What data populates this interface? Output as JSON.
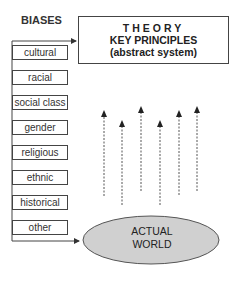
{
  "heading": "BIASES",
  "biases": [
    {
      "label": "cultural"
    },
    {
      "label": "racial"
    },
    {
      "label": "social class"
    },
    {
      "label": "gender"
    },
    {
      "label": "religious"
    },
    {
      "label": "ethnic"
    },
    {
      "label": "historical"
    },
    {
      "label": "other"
    }
  ],
  "theory": {
    "title": "THEORY",
    "line1": "KEY PRINCIPLES",
    "line2": "(abstract system)"
  },
  "world": {
    "line1": "ACTUAL",
    "line2": "WORLD"
  },
  "colors": {
    "ellipse_fill": "#d0d0d0",
    "stroke": "#444444"
  }
}
